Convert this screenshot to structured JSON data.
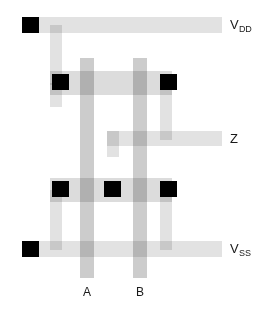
{
  "figure": {
    "type": "cmos-layout-diagram",
    "width": 272,
    "height": 315,
    "background": "#ffffff"
  },
  "colors": {
    "metal": "#e2e2e2",
    "poly": "#cccccc",
    "diffusion": "#dcdcdc",
    "contact": "#000000",
    "text": "#1a1a1a"
  },
  "labels": {
    "vdd": {
      "main": "V",
      "sub": "DD"
    },
    "z": {
      "main": "Z",
      "sub": ""
    },
    "vss": {
      "main": "V",
      "sub": "SS"
    },
    "gate_a": "A",
    "gate_b": "B"
  },
  "rails": [
    {
      "name": "vdd-rail",
      "x": 25,
      "y": 17,
      "w": 197,
      "h": 16
    },
    {
      "name": "z-rail",
      "x": 107,
      "y": 131,
      "w": 115,
      "h": 15
    },
    {
      "name": "vss-rail",
      "x": 25,
      "y": 241,
      "w": 197,
      "h": 16
    }
  ],
  "horizontal_bands": [
    {
      "name": "pmos-active-band",
      "x": 50,
      "y": 71,
      "w": 122,
      "h": 24
    },
    {
      "name": "nmos-active-band",
      "x": 50,
      "y": 178,
      "w": 122,
      "h": 24
    }
  ],
  "vertical_metal": [
    {
      "name": "vdd-to-pmos-strip",
      "x": 50,
      "y": 25,
      "w": 12,
      "h": 60
    },
    {
      "name": "pmos-left-drop-strip",
      "x": 50,
      "y": 83,
      "w": 12,
      "h": 24
    },
    {
      "name": "pmos-right-down-strip",
      "x": 160,
      "y": 78,
      "w": 12,
      "h": 62
    },
    {
      "name": "z-riser-strip",
      "x": 107,
      "y": 131,
      "w": 12,
      "h": 24
    },
    {
      "name": "nmos-left-to-vss-strip",
      "x": 50,
      "y": 190,
      "w": 12,
      "h": 60
    },
    {
      "name": "nmos-right-to-vss-strip",
      "x": 160,
      "y": 190,
      "w": 12,
      "h": 60
    }
  ],
  "poly_gates": [
    {
      "name": "poly-gate-a",
      "label": "A",
      "x": 80,
      "y": 58,
      "w": 14,
      "h": 220
    },
    {
      "name": "poly-gate-b",
      "label": "B",
      "x": 133,
      "y": 58,
      "w": 14,
      "h": 220
    }
  ],
  "contacts": [
    {
      "name": "contact-vdd-left",
      "x": 22,
      "y": 17
    },
    {
      "name": "contact-pmos-left",
      "x": 52,
      "y": 74
    },
    {
      "name": "contact-pmos-right",
      "x": 160,
      "y": 74
    },
    {
      "name": "contact-nmos-left",
      "x": 52,
      "y": 181
    },
    {
      "name": "contact-nmos-mid",
      "x": 104,
      "y": 181
    },
    {
      "name": "contact-nmos-right",
      "x": 160,
      "y": 181
    },
    {
      "name": "contact-vss-left",
      "x": 22,
      "y": 241
    }
  ],
  "contact_size": {
    "w": 17,
    "h": 16
  },
  "label_positions": {
    "vdd": {
      "x": 230,
      "y": 18
    },
    "z": {
      "x": 230,
      "y": 132
    },
    "vss": {
      "x": 230,
      "y": 242
    },
    "gate_a": {
      "x": 80,
      "y": 286
    },
    "gate_b": {
      "x": 133,
      "y": 286
    }
  }
}
